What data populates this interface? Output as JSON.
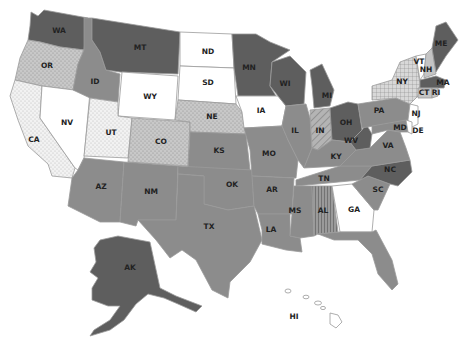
{
  "map": {
    "title": "United States",
    "categories": {
      "dark": {
        "fill": "#5e5e5e"
      },
      "medium": {
        "fill": "#8c8c8c"
      },
      "white": {
        "fill": "#ffffff"
      },
      "light_dotted": {
        "fill": "#c8c8c8",
        "pattern": "dots"
      },
      "very_light_dotted": {
        "fill": "#f0f0f0",
        "pattern": "dots"
      },
      "light_grid": {
        "fill": "#d0d0d0",
        "pattern": "grid"
      },
      "diagonal_hatch": {
        "fill": "#a8a8a8",
        "pattern": "diagonal"
      },
      "vertical_hatch": {
        "fill": "#8c8c8c",
        "pattern": "vertical"
      },
      "light_plain": {
        "fill": "#c4c4c4"
      }
    },
    "states": [
      {
        "code": "WA",
        "category": "dark"
      },
      {
        "code": "OR",
        "category": "light_dotted"
      },
      {
        "code": "CA",
        "category": "very_light_dotted"
      },
      {
        "code": "NV",
        "category": "white"
      },
      {
        "code": "ID",
        "category": "medium"
      },
      {
        "code": "MT",
        "category": "dark"
      },
      {
        "code": "WY",
        "category": "white"
      },
      {
        "code": "UT",
        "category": "very_light_dotted"
      },
      {
        "code": "CO",
        "category": "light_dotted"
      },
      {
        "code": "AZ",
        "category": "medium"
      },
      {
        "code": "NM",
        "category": "medium"
      },
      {
        "code": "ND",
        "category": "white"
      },
      {
        "code": "SD",
        "category": "white"
      },
      {
        "code": "NE",
        "category": "light_dotted"
      },
      {
        "code": "KS",
        "category": "medium"
      },
      {
        "code": "OK",
        "category": "medium"
      },
      {
        "code": "TX",
        "category": "medium"
      },
      {
        "code": "MN",
        "category": "dark"
      },
      {
        "code": "IA",
        "category": "white"
      },
      {
        "code": "MO",
        "category": "medium"
      },
      {
        "code": "AR",
        "category": "medium"
      },
      {
        "code": "LA",
        "category": "medium"
      },
      {
        "code": "WI",
        "category": "dark"
      },
      {
        "code": "IL",
        "category": "medium"
      },
      {
        "code": "MI",
        "category": "dark"
      },
      {
        "code": "IN",
        "category": "diagonal_hatch"
      },
      {
        "code": "OH",
        "category": "dark"
      },
      {
        "code": "KY",
        "category": "medium"
      },
      {
        "code": "TN",
        "category": "medium"
      },
      {
        "code": "MS",
        "category": "medium"
      },
      {
        "code": "AL",
        "category": "vertical_hatch"
      },
      {
        "code": "GA",
        "category": "white"
      },
      {
        "code": "FL",
        "category": "medium"
      },
      {
        "code": "SC",
        "category": "medium"
      },
      {
        "code": "NC",
        "category": "dark"
      },
      {
        "code": "VA",
        "category": "medium"
      },
      {
        "code": "WV",
        "category": "dark"
      },
      {
        "code": "PA",
        "category": "medium"
      },
      {
        "code": "NY",
        "category": "light_grid"
      },
      {
        "code": "NJ",
        "category": "white"
      },
      {
        "code": "DE",
        "category": "white"
      },
      {
        "code": "MD",
        "category": "medium"
      },
      {
        "code": "CT",
        "category": "light_plain"
      },
      {
        "code": "RI",
        "category": "light_plain"
      },
      {
        "code": "MA",
        "category": "dark"
      },
      {
        "code": "VT",
        "category": "white"
      },
      {
        "code": "NH",
        "category": "light_plain"
      },
      {
        "code": "ME",
        "category": "dark"
      },
      {
        "code": "AK",
        "category": "dark"
      },
      {
        "code": "HI",
        "category": "white"
      }
    ]
  }
}
